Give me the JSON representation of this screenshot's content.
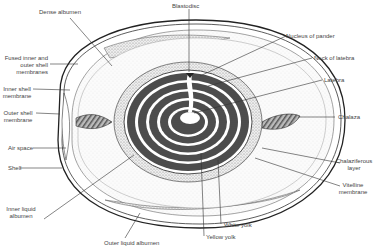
{
  "diagram": {
    "labels": {
      "dense_albumen": "Dense albumen",
      "blastodisc": "Blastodisc",
      "nucleus_of_pander": "Nucleus of pander",
      "fused_membranes": "Fused inner and\nouter shell\nmembranes",
      "neck_of_latebra": "Neck of latebra",
      "inner_shell_membrane": "Inner shell\nmembrane",
      "latebra": "Latebra",
      "outer_shell_membrane": "Outer shell\nmembrane",
      "chalaza": "Chalaza",
      "air_space": "Air space",
      "shell": "Shell",
      "chalaziferous_layer": "Chalaziferous\nlayer",
      "vitelline_membrane": "Vitelline\nmembrane",
      "inner_liquid_albumen": "Inner liquid\nalbumen",
      "white_yolk": "White yolk",
      "yellow_yolk": "Yellow yolk",
      "outer_liquid_albumen": "Outer liquid albumen"
    }
  }
}
